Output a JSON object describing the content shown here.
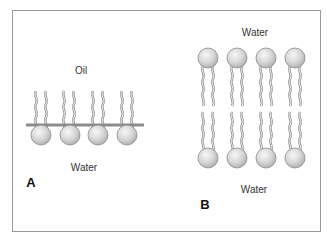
{
  "figure": {
    "panels": [
      {
        "id": "A",
        "label": "A",
        "description": "Monolayer of amphiphilic molecules at an oil/water interface",
        "top_medium": "Oil",
        "bottom_medium": "Water",
        "molecule_count": 4
      },
      {
        "id": "B",
        "label": "B",
        "description": "Bilayer of amphiphilic molecules between water phases",
        "top_medium": "Water",
        "bottom_medium": "Water",
        "molecule_count_per_leaflet": 4
      }
    ],
    "colors": {
      "frame": "#9a9a9a",
      "head_fill_light": "#f2f2f2",
      "head_fill_dark": "#b8b8b8",
      "head_stroke": "#8a8a8a",
      "tail": "#8c8c8c",
      "interface_bar": "#8c8c8c",
      "text": "#333333"
    }
  }
}
